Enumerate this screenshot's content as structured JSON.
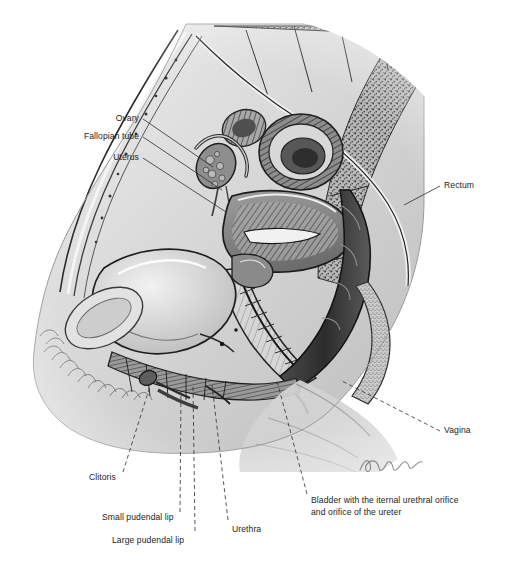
{
  "figure": {
    "type": "anatomical-illustration",
    "style": "grayscale engraving / stipple drawing",
    "signature": "artist signature, lower right of illustration",
    "background_color": "#ffffff",
    "ink_color": "#1d1d1d"
  },
  "labels": [
    {
      "id": "ovary",
      "text": "Ovary",
      "x": 108,
      "y": 113,
      "align": "right",
      "anchor_x": 143,
      "anchor_y": 119,
      "target_x": 213,
      "target_y": 167
    },
    {
      "id": "fallopian-tube",
      "text": "Fallopian tube",
      "x": 68,
      "y": 131,
      "align": "right",
      "anchor_x": 143,
      "anchor_y": 137,
      "target_x": 222,
      "target_y": 190
    },
    {
      "id": "uterus",
      "text": "Uterus",
      "x": 88,
      "y": 152,
      "align": "right",
      "anchor_x": 143,
      "anchor_y": 158,
      "target_x": 226,
      "target_y": 212
    },
    {
      "id": "rectum",
      "text": "Rectum",
      "x": 444,
      "y": 180,
      "align": "left",
      "anchor_x": 440,
      "anchor_y": 186,
      "target_x": 404,
      "target_y": 205
    },
    {
      "id": "vagina",
      "text": "Vagina",
      "x": 444,
      "y": 425,
      "align": "left",
      "anchor_x": 440,
      "anchor_y": 431,
      "target_x": 340,
      "target_y": 380
    },
    {
      "id": "clitoris",
      "text": "Clitoris",
      "x": 89,
      "y": 472,
      "align": "left",
      "anchor_x": 123,
      "anchor_y": 472,
      "target_x": 151,
      "target_y": 383
    },
    {
      "id": "small-pudendal-lip",
      "text": "Small pudendal lip",
      "x": 102,
      "y": 512,
      "align": "left",
      "anchor_x": 180,
      "anchor_y": 512,
      "target_x": 181,
      "target_y": 391
    },
    {
      "id": "large-pudendal-lip",
      "text": "Large pudendal lip",
      "x": 112,
      "y": 535,
      "align": "left",
      "anchor_x": 195,
      "anchor_y": 531,
      "target_x": 193,
      "target_y": 386
    },
    {
      "id": "urethra",
      "text": "Urethra",
      "x": 232,
      "y": 524,
      "align": "left",
      "anchor_x": 228,
      "anchor_y": 520,
      "target_x": 212,
      "target_y": 385
    },
    {
      "id": "bladder",
      "text": "Bladder with the iternal urethral orifice and orifice of the ureter",
      "x": 311,
      "y": 494,
      "align": "left",
      "anchor_x": 307,
      "anchor_y": 494,
      "target_x": 277,
      "target_y": 381
    }
  ]
}
